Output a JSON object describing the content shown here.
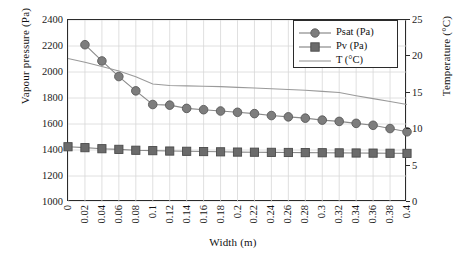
{
  "chart_data": {
    "type": "line",
    "title": "",
    "xlabel": "Width (m)",
    "ylabel": "Vapour pressure (Pa)",
    "y2label": "Temperature (°C)",
    "xlim": [
      0,
      0.4
    ],
    "ylim": [
      1000,
      2400
    ],
    "y2lim": [
      0,
      25
    ],
    "grid": true,
    "legend_position": "top-right",
    "x": [
      0,
      0.02,
      0.04,
      0.06,
      0.08,
      0.1,
      0.12,
      0.14,
      0.16,
      0.18,
      0.2,
      0.22,
      0.24,
      0.26,
      0.28,
      0.3,
      0.32,
      0.34,
      0.36,
      0.38,
      0.4
    ],
    "xticklabels": [
      "0",
      "0.02",
      "0.04",
      "0.06",
      "0.08",
      "0.1",
      "0.12",
      "0.14",
      "0.16",
      "0.18",
      "0.2",
      "0.22",
      "0.24",
      "0.26",
      "0.28",
      "0.3",
      "0.32",
      "0.34",
      "0.36",
      "0.38",
      "0.4"
    ],
    "yticklabels": [
      "1000",
      "1200",
      "1400",
      "1600",
      "1800",
      "2000",
      "2200",
      "2400"
    ],
    "yticks": [
      1000,
      1200,
      1400,
      1600,
      1800,
      2000,
      2200,
      2400
    ],
    "y2ticklabels": [
      "0",
      "5",
      "10",
      "15",
      "20",
      "25"
    ],
    "y2ticks": [
      0,
      5,
      10,
      15,
      20,
      25
    ],
    "series": [
      {
        "name": "Psat (Pa)",
        "axis": "left",
        "marker": "circle",
        "color": "#7d7d7d",
        "line_color": "#8a8a8a",
        "values": [
          null,
          2210,
          2085,
          1965,
          1855,
          1750,
          1745,
          1720,
          1710,
          1700,
          1690,
          1680,
          1665,
          1655,
          1645,
          1630,
          1620,
          1605,
          1590,
          1565,
          1540
        ]
      },
      {
        "name": "Pv (Pa)",
        "axis": "left",
        "marker": "square",
        "color": "#6b6b6b",
        "line_color": "#8a8a8a",
        "values": [
          1425,
          1418,
          1410,
          1405,
          1398,
          1395,
          1392,
          1390,
          1388,
          1386,
          1384,
          1383,
          1382,
          1381,
          1380,
          1379,
          1378,
          1377,
          1376,
          1375,
          1374
        ]
      },
      {
        "name": "T (°C)",
        "axis": "right",
        "marker": "none",
        "color": "#9a9a9a",
        "line_color": "#9a9a9a",
        "values": [
          19.7,
          19.2,
          18.6,
          18.0,
          17.2,
          16.2,
          16.0,
          15.95,
          15.9,
          15.85,
          15.75,
          15.65,
          15.55,
          15.45,
          15.35,
          15.2,
          15.05,
          14.6,
          14.2,
          13.8,
          13.4
        ]
      }
    ]
  },
  "legend": {
    "items": [
      {
        "label": "Psat (Pa)",
        "marker": "circle"
      },
      {
        "label": "Pv (Pa)",
        "marker": "square"
      },
      {
        "label": "T (°C)",
        "marker": "line"
      }
    ]
  }
}
